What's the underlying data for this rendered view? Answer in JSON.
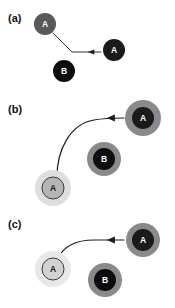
{
  "figure": {
    "width": 175,
    "height": 308,
    "background_color": "#ffffff",
    "panels": [
      {
        "id": "panel-a",
        "label": "(a)",
        "label_x": 8,
        "label_y": 22,
        "nodes": [
          {
            "id": "a-node-a-origin",
            "letter": "A",
            "cx": 45,
            "cy": 24,
            "core_r": 11,
            "core_color": "#595959",
            "halo_r": 0,
            "halo_color": "none",
            "ring_r": 0,
            "ring_color": "none",
            "letter_color": "#ffffff",
            "outline": "none"
          },
          {
            "id": "a-node-a-target",
            "letter": "A",
            "cx": 114,
            "cy": 50,
            "core_r": 11,
            "core_color": "#1a1a1a",
            "halo_r": 0,
            "halo_color": "none",
            "ring_r": 0,
            "ring_color": "none",
            "letter_color": "#ffffff",
            "outline": "none"
          },
          {
            "id": "a-node-b",
            "letter": "B",
            "cx": 64,
            "cy": 71,
            "core_r": 11,
            "core_color": "#0d0d0d",
            "halo_r": 0,
            "halo_color": "none",
            "ring_r": 0,
            "ring_color": "none",
            "letter_color": "#ffffff",
            "outline": "none"
          }
        ],
        "trajectory": {
          "id": "a-trajectory",
          "path": "M 53 33 L 72 52 L 101 52",
          "style": "thin",
          "arrow_x": 92,
          "arrow_y": 52,
          "arrow_dir": "left"
        }
      },
      {
        "id": "panel-b",
        "label": "(b)",
        "label_x": 8,
        "label_y": 113,
        "nodes": [
          {
            "id": "b-node-a-target",
            "letter": "A",
            "cx": 143,
            "cy": 118,
            "core_r": 11,
            "core_color": "#1a1a1a",
            "halo_r": 0,
            "halo_color": "none",
            "ring_r": 18,
            "ring_color": "#8a8a8a",
            "letter_color": "#ffffff",
            "outline": "none"
          },
          {
            "id": "b-node-b",
            "letter": "B",
            "cx": 104,
            "cy": 159,
            "core_r": 11,
            "core_color": "#0d0d0d",
            "halo_r": 0,
            "halo_color": "none",
            "ring_r": 17,
            "ring_color": "#8a8a8a",
            "letter_color": "#ffffff",
            "outline": "none"
          },
          {
            "id": "b-node-a-origin",
            "letter": "A",
            "cx": 53,
            "cy": 188,
            "core_r": 11,
            "core_color": "#b5b5b5",
            "halo_r": 18,
            "halo_color": "#dedede",
            "ring_r": 0,
            "ring_color": "none",
            "letter_color": "#1a1a1a",
            "outline": "#3a3a3a"
          }
        ],
        "trajectory": {
          "id": "b-trajectory",
          "path": "M 57 177 C 57 150 70 124 94 120 C 105 118 112 118 124 118",
          "style": "normal",
          "arrow_x": 112,
          "arrow_y": 118,
          "arrow_dir": "left"
        }
      },
      {
        "id": "panel-c",
        "label": "(c)",
        "label_x": 8,
        "label_y": 228,
        "nodes": [
          {
            "id": "c-node-a-target",
            "letter": "A",
            "cx": 143,
            "cy": 240,
            "core_r": 11,
            "core_color": "#1a1a1a",
            "halo_r": 0,
            "halo_color": "none",
            "ring_r": 17,
            "ring_color": "#8a8a8a",
            "letter_color": "#ffffff",
            "outline": "none"
          },
          {
            "id": "c-node-b",
            "letter": "B",
            "cx": 105,
            "cy": 280,
            "core_r": 11,
            "core_color": "#0d0d0d",
            "halo_r": 0,
            "halo_color": "none",
            "ring_r": 17,
            "ring_color": "#8a8a8a",
            "letter_color": "#ffffff",
            "outline": "none"
          },
          {
            "id": "c-node-a-origin",
            "letter": "A",
            "cx": 53,
            "cy": 269,
            "core_r": 11,
            "core_color": "#d2d2d2",
            "halo_r": 18,
            "halo_color": "#e8e8e8",
            "ring_r": 0,
            "ring_color": "none",
            "letter_color": "#1a1a1a",
            "outline": "#3a3a3a"
          }
        ],
        "trajectory": {
          "id": "c-trajectory",
          "path": "M 58 258 C 64 246 76 240 94 240 C 106 240 114 240 124 240",
          "style": "normal",
          "arrow_x": 112,
          "arrow_y": 240,
          "arrow_dir": "left"
        }
      }
    ]
  }
}
